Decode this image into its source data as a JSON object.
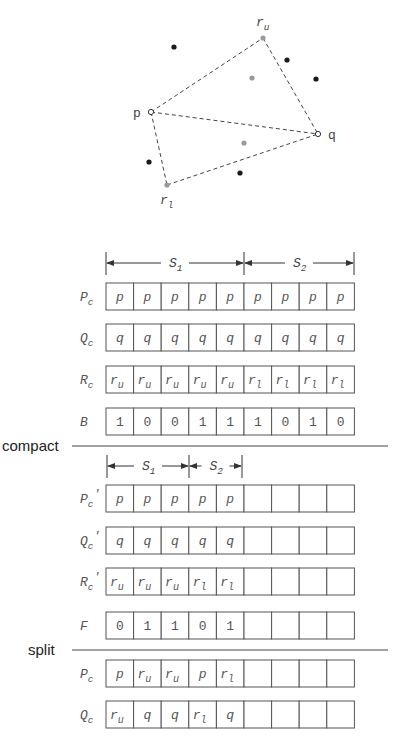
{
  "figure": {
    "points": {
      "p": {
        "label": "p",
        "x": 151,
        "y": 112,
        "lx": 133,
        "ly": 117
      },
      "q": {
        "label": "q",
        "x": 318,
        "y": 134,
        "lx": 328,
        "ly": 139
      },
      "r_u": {
        "label": "r",
        "sub": "u",
        "x": 263,
        "y": 38,
        "lx": 256,
        "ly": 26
      },
      "r_l": {
        "label": "r",
        "sub": "l",
        "x": 167,
        "y": 185,
        "lx": 160,
        "ly": 204
      }
    },
    "black_points": [
      [
        174,
        47
      ],
      [
        287,
        60
      ],
      [
        316,
        79
      ],
      [
        149,
        162
      ],
      [
        240,
        173
      ]
    ],
    "gray_points": [
      [
        252,
        78
      ],
      [
        244,
        143
      ]
    ],
    "colors": {
      "black_point": "#1a1a1a",
      "gray_point": "#9a9a9a",
      "line": "#444444",
      "box": "#555555",
      "text": "#555555"
    }
  },
  "grid": {
    "left": 106,
    "cell_width": 27.6,
    "cell_height": 27,
    "columns": 9
  },
  "dimensions": [
    {
      "y": 263,
      "tick_top": 252,
      "tick_bottom": 275,
      "segments": [
        {
          "label": "S",
          "sub": "1",
          "x0": 106,
          "x1": 244
        },
        {
          "label": "S",
          "sub": "2",
          "x0": 244,
          "x1": 354
        }
      ]
    },
    {
      "y": 466,
      "tick_top": 455,
      "tick_bottom": 478,
      "segments": [
        {
          "label": "S",
          "sub": "1",
          "x0": 107,
          "x1": 189
        },
        {
          "label": "S",
          "sub": "2",
          "x0": 189,
          "x1": 242
        }
      ]
    }
  ],
  "rows": [
    {
      "name": "P_c",
      "label": "P",
      "sub": "c",
      "prime": false,
      "top": 283,
      "cells": [
        [
          "p"
        ],
        [
          "p"
        ],
        [
          "p"
        ],
        [
          "p"
        ],
        [
          "p"
        ],
        [
          "p"
        ],
        [
          "p"
        ],
        [
          "p"
        ],
        [
          "p"
        ]
      ]
    },
    {
      "name": "Q_c",
      "label": "Q",
      "sub": "c",
      "prime": false,
      "top": 324,
      "cells": [
        [
          "q"
        ],
        [
          "q"
        ],
        [
          "q"
        ],
        [
          "q"
        ],
        [
          "q"
        ],
        [
          "q"
        ],
        [
          "q"
        ],
        [
          "q"
        ],
        [
          "q"
        ]
      ]
    },
    {
      "name": "R_c",
      "label": "R",
      "sub": "c",
      "prime": false,
      "top": 366,
      "cells": [
        [
          "r",
          "u"
        ],
        [
          "r",
          "u"
        ],
        [
          "r",
          "u"
        ],
        [
          "r",
          "u"
        ],
        [
          "r",
          "u"
        ],
        [
          "r",
          "l"
        ],
        [
          "r",
          "l"
        ],
        [
          "r",
          "l"
        ],
        [
          "r",
          "l"
        ]
      ]
    },
    {
      "name": "B",
      "label": "B",
      "sub": "",
      "prime": false,
      "top": 408,
      "numeric": true,
      "cells": [
        [
          "1"
        ],
        [
          "0"
        ],
        [
          "0"
        ],
        [
          "1"
        ],
        [
          "1"
        ],
        [
          "1"
        ],
        [
          "0"
        ],
        [
          "1"
        ],
        [
          "0"
        ]
      ]
    },
    {
      "name": "P_c_prime",
      "label": "P",
      "sub": "c",
      "prime": true,
      "top": 485,
      "cells": [
        [
          "p"
        ],
        [
          "p"
        ],
        [
          "p"
        ],
        [
          "p"
        ],
        [
          "p"
        ],
        [],
        [],
        [],
        []
      ]
    },
    {
      "name": "Q_c_prime",
      "label": "Q",
      "sub": "c",
      "prime": true,
      "top": 527,
      "cells": [
        [
          "q"
        ],
        [
          "q"
        ],
        [
          "q"
        ],
        [
          "q"
        ],
        [
          "q"
        ],
        [],
        [],
        [],
        []
      ]
    },
    {
      "name": "R_c_prime",
      "label": "R",
      "sub": "c",
      "prime": true,
      "top": 568,
      "cells": [
        [
          "r",
          "u"
        ],
        [
          "r",
          "u"
        ],
        [
          "r",
          "u"
        ],
        [
          "r",
          "l"
        ],
        [
          "r",
          "l"
        ],
        [],
        [],
        [],
        []
      ]
    },
    {
      "name": "F",
      "label": "F",
      "sub": "",
      "prime": false,
      "top": 612,
      "numeric": true,
      "cells": [
        [
          "0"
        ],
        [
          "1"
        ],
        [
          "1"
        ],
        [
          "0"
        ],
        [
          "1"
        ],
        [],
        [],
        [],
        []
      ]
    },
    {
      "name": "P_c_split",
      "label": "P",
      "sub": "c",
      "prime": false,
      "top": 660,
      "cells": [
        [
          "p"
        ],
        [
          "r",
          "u"
        ],
        [
          "r",
          "u"
        ],
        [
          "p"
        ],
        [
          "r",
          "l"
        ],
        [],
        [],
        [],
        []
      ]
    },
    {
      "name": "Q_c_split",
      "label": "Q",
      "sub": "c",
      "prime": false,
      "top": 701,
      "cells": [
        [
          "r",
          "u"
        ],
        [
          "q"
        ],
        [
          "q"
        ],
        [
          "r",
          "l"
        ],
        [
          "q"
        ],
        [],
        [],
        [],
        []
      ]
    }
  ],
  "separators": [
    {
      "label": "compact",
      "y": 446,
      "text_x": 2,
      "line_x0": 72,
      "line_x1": 388
    },
    {
      "label": "split",
      "y": 650,
      "text_x": 28,
      "line_x0": 72,
      "line_x1": 388
    }
  ]
}
